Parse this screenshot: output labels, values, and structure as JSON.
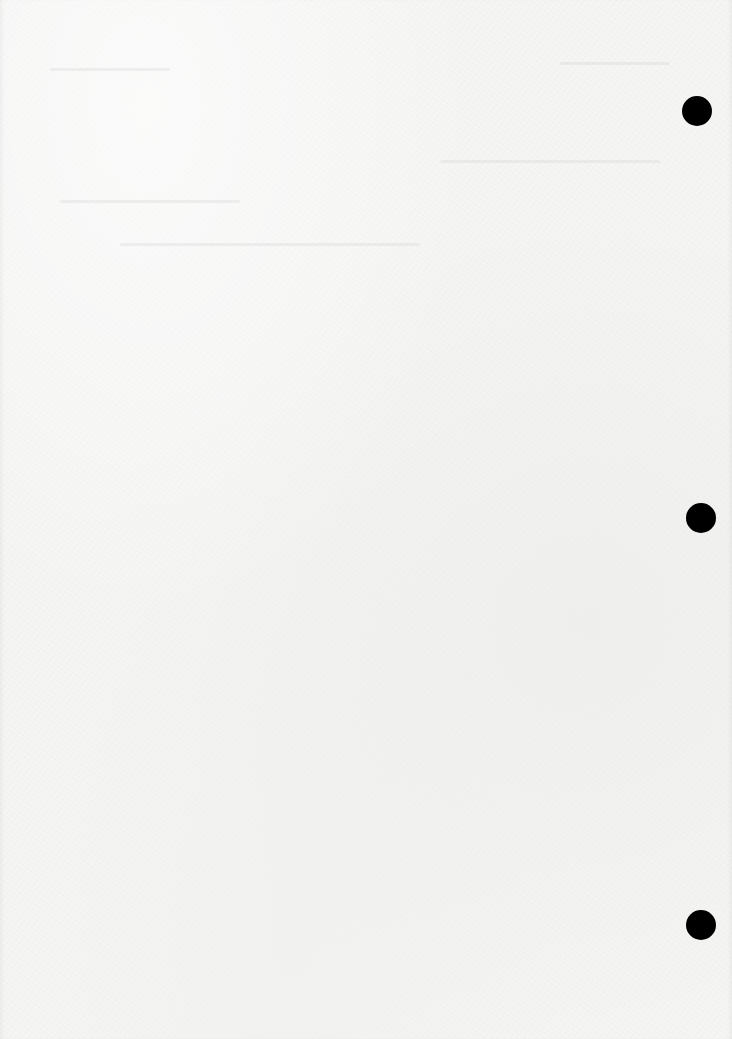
{
  "document": {
    "type": "scanned blank page",
    "paper_color": "#f5f5f4",
    "text_content": "",
    "punch_holes": [
      {
        "cx": 697,
        "cy": 111,
        "r": 15,
        "color": "#000000"
      },
      {
        "cx": 701,
        "cy": 518,
        "r": 15,
        "color": "#000000"
      },
      {
        "cx": 701,
        "cy": 925,
        "r": 15,
        "color": "#000000"
      }
    ]
  }
}
